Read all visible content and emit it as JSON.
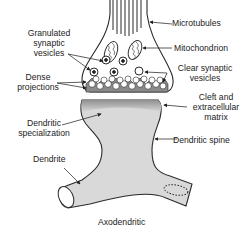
{
  "diagram": {
    "title": "Axodendritic",
    "labels": {
      "granulated_vesicles": [
        "Granulated",
        "synaptic",
        "vesicles"
      ],
      "dense_projections": [
        "Dense",
        "projections"
      ],
      "microtubules": "Microtubules",
      "mitochondrion": "Mitochondrion",
      "clear_vesicles": [
        "Clear synaptic",
        "vesicles"
      ],
      "cleft": [
        "Cleft and",
        "extracellular",
        "matrix"
      ],
      "dendritic_specialization": [
        "Dendritic",
        "specialization"
      ],
      "dendritic_spine": "Dendritic spine",
      "dendrite": "Dendrite"
    },
    "colors": {
      "outline": "#2a2a2a",
      "fill_light": "#d9d9d9",
      "fill_dark": "#8a8a8a",
      "background": "#ffffff"
    }
  }
}
